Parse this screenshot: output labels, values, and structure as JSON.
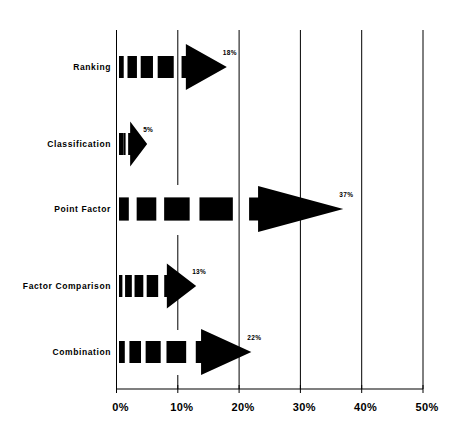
{
  "chart_data": {
    "type": "bar",
    "orientation": "horizontal",
    "style": "arrow-bars",
    "title": "",
    "xlabel": "",
    "ylabel": "",
    "categories": [
      "Ranking",
      "Classification",
      "Point Factor",
      "Factor Comparison",
      "Combination"
    ],
    "values": [
      18,
      5,
      37,
      13,
      22
    ],
    "value_labels": [
      "18%",
      "5%",
      "37%",
      "13%",
      "22%"
    ],
    "xlim": [
      0,
      50
    ],
    "x_ticks": [
      0,
      10,
      20,
      30,
      40,
      50
    ],
    "x_tick_labels": [
      "0%",
      "10%",
      "20%",
      "30%",
      "40%",
      "50%"
    ],
    "grid": "vertical",
    "legend": "none",
    "colors": {
      "bar": "#000000",
      "grid": "#000000",
      "background": "#ffffff"
    }
  }
}
